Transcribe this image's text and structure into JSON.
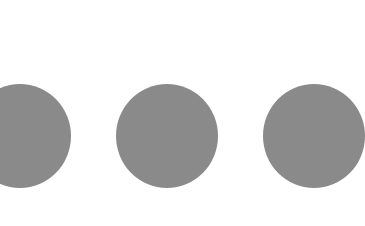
{
  "image": {
    "background": "#ffffff",
    "dots": [
      {
        "name": "left",
        "left": -31,
        "color": "#8a8a8a"
      },
      {
        "name": "center",
        "left": 116,
        "color": "#8a8a8a"
      },
      {
        "name": "right",
        "left": 263,
        "color": "#8a8a8a"
      }
    ]
  }
}
